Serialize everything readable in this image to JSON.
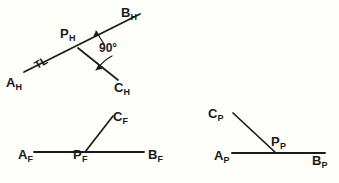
{
  "figure": {
    "background_color": "#fefefb",
    "line_color": "#1a1a1a",
    "text_color": "#1a1a1a"
  },
  "views": {
    "horizontal": {
      "name": "Horizontal (top) view",
      "labels": {
        "a": {
          "base": "A",
          "sub": "H"
        },
        "b": {
          "base": "B",
          "sub": "H"
        },
        "c": {
          "base": "C",
          "sub": "H"
        },
        "p": {
          "base": "P",
          "sub": "H"
        }
      },
      "annotations": {
        "true_length": "TL",
        "angle": "90°"
      },
      "geometry": {
        "A": [
          24,
          72
        ],
        "B": [
          140,
          14
        ],
        "P": [
          78,
          48
        ],
        "C": [
          118,
          80
        ]
      }
    },
    "frontal": {
      "name": "Frontal (front) view",
      "labels": {
        "a": {
          "base": "A",
          "sub": "F"
        },
        "b": {
          "base": "B",
          "sub": "F"
        },
        "c": {
          "base": "C",
          "sub": "F"
        },
        "p": {
          "base": "P",
          "sub": "F"
        }
      },
      "geometry": {
        "A": [
          34,
          152
        ],
        "B": [
          144,
          152
        ],
        "P": [
          85,
          152
        ],
        "C": [
          113,
          116
        ]
      }
    },
    "profile": {
      "name": "Profile (side) view",
      "labels": {
        "a": {
          "base": "A",
          "sub": "P"
        },
        "b": {
          "base": "B",
          "sub": "P"
        },
        "c": {
          "base": "C",
          "sub": "P"
        },
        "p": {
          "base": "P",
          "sub": "P"
        }
      },
      "geometry": {
        "A": [
          232,
          153
        ],
        "B": [
          325,
          153
        ],
        "P": [
          276,
          153
        ],
        "C": [
          233,
          113
        ]
      }
    }
  }
}
